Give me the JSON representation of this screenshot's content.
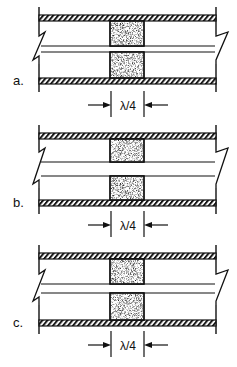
{
  "figure": {
    "colors": {
      "ink": "#111111",
      "background": "#ffffff",
      "stipple": "#8a8a8a"
    },
    "panels": [
      {
        "id": "a",
        "label": "a.",
        "dimension_label": "λ/4",
        "top_bar_y": 15,
        "bottom_bar_y": 78,
        "inner_line_top_y": 46,
        "inner_line_bottom_y": 52,
        "upper_block": {
          "y1": 21,
          "y2": 46
        },
        "lower_block": {
          "y1": 52,
          "y2": 78
        },
        "dim_y": 105
      },
      {
        "id": "b",
        "label": "b.",
        "dimension_label": "λ/4",
        "top_bar_y": 133,
        "bottom_bar_y": 200,
        "inner_line_top_y": 162,
        "inner_line_bottom_y": 176,
        "upper_block": {
          "y1": 139,
          "y2": 162
        },
        "lower_block": {
          "y1": 176,
          "y2": 200
        },
        "dim_y": 225
      },
      {
        "id": "c",
        "label": "c.",
        "dimension_label": "λ/4",
        "top_bar_y": 253,
        "bottom_bar_y": 320,
        "inner_line_top_y": 284,
        "inner_line_bottom_y": 293,
        "upper_block": {
          "y1": 259,
          "y2": 284
        },
        "lower_block": {
          "y1": 293,
          "y2": 320
        },
        "dim_y": 345
      }
    ]
  }
}
